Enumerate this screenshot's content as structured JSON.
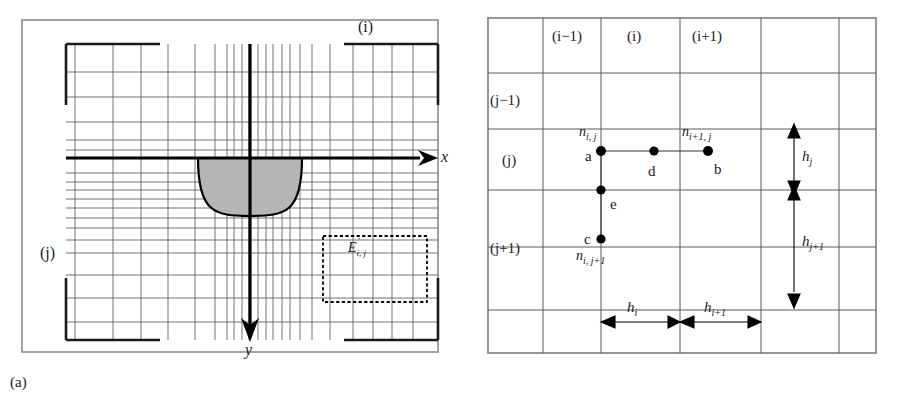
{
  "figure": {
    "panels": [
      {
        "id": "a",
        "caption": "(a)",
        "title_note": "Non-uniform finite-difference mesh over weld cross-section with x and y axes",
        "axes": {
          "x_label": "x",
          "y_label": "y",
          "x_direction": "right",
          "y_direction": "down"
        },
        "index_labels": {
          "column_index": "(i)",
          "row_index": "(j)"
        },
        "control_volume": {
          "label_base": "E",
          "label_sub": "i, j",
          "label_dot": "˙",
          "label_plain": "Ė i,j",
          "style": "dashed"
        },
        "weld_pool": {
          "name": "fusion-zone",
          "fill_color": "#b3b3b3",
          "stroke_color": "#000000",
          "shape": "u-shaped"
        },
        "grid": {
          "x_lines": [
            75,
            113,
            141,
            168,
            195,
            215,
            227,
            234,
            242,
            249,
            251,
            258,
            266,
            273,
            282,
            290,
            300,
            312,
            330,
            353,
            373,
            392,
            413,
            435
          ],
          "y_lines": [
            46,
            72,
            97,
            122,
            140,
            150,
            158,
            173,
            182,
            190,
            199,
            208,
            218,
            228,
            240,
            253,
            275,
            298,
            322,
            338
          ],
          "color": "#4d4d4d"
        },
        "frame_color": "#808080",
        "axis_color": "#000000"
      },
      {
        "id": "b",
        "caption": "(b)",
        "title_note": "Detail of mesh showing nodes a, b, c, d, e and spacings",
        "column_headers": [
          "(i−1)",
          "(i)",
          "(i+1)"
        ],
        "row_headers": [
          "(j−1)",
          "(j)",
          "(j+1)"
        ],
        "nodes": [
          {
            "key": "a",
            "letter": "a",
            "label": "n",
            "sub": "i, j",
            "pos": "top-left-of-cell-i-j"
          },
          {
            "key": "d",
            "letter": "d",
            "label": "",
            "sub": "",
            "pos": "midpoint-between-a-and-b"
          },
          {
            "key": "b",
            "letter": "b",
            "label": "n",
            "sub": "i+1, j",
            "pos": "top-left-of-cell-i+1-j"
          },
          {
            "key": "e",
            "letter": "e",
            "label": "",
            "sub": "",
            "pos": "midpoint-between-a-and-c"
          },
          {
            "key": "c",
            "letter": "c",
            "label": "n",
            "sub": "i, j+1",
            "pos": "top-left-of-cell-i-j+1"
          }
        ],
        "dimensions": [
          {
            "key": "h_i",
            "base": "h",
            "sub": "i",
            "orientation": "horizontal"
          },
          {
            "key": "h_i1",
            "base": "h",
            "sub": "i+1",
            "orientation": "horizontal"
          },
          {
            "key": "h_j",
            "base": "h",
            "sub": "j",
            "orientation": "vertical"
          },
          {
            "key": "h_j1",
            "base": "h",
            "sub": "j+1",
            "orientation": "vertical"
          }
        ],
        "grid": {
          "x_lines": [
            28,
            83,
            141,
            220,
            301,
            379,
            416
          ],
          "y_lines": [
            18,
            73,
            129,
            190,
            247,
            310,
            353
          ],
          "color": "#4d4d4d"
        },
        "frame_color": "#808080",
        "node_color": "#000000"
      }
    ]
  }
}
